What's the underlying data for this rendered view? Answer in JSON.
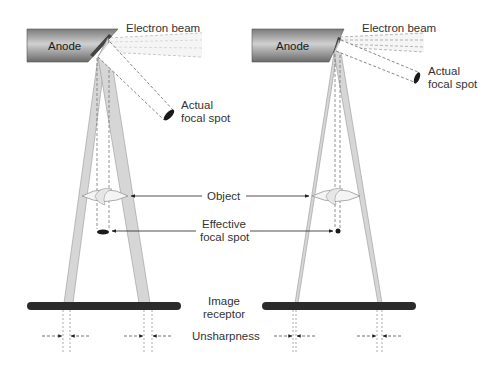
{
  "diagram": {
    "panels": [
      {
        "id": "large-focal-spot",
        "anode_label": "Anode",
        "electron_beam_label": "Electron beam",
        "actual_focal_spot_label": [
          "Actual",
          "focal spot"
        ]
      },
      {
        "id": "small-focal-spot",
        "anode_label": "Anode",
        "electron_beam_label": "Electron beam",
        "actual_focal_spot_label": [
          "Actual",
          "focal spot"
        ]
      }
    ],
    "center_labels": {
      "object": "Object",
      "effective_focal_spot": [
        "Effective",
        "focal spot"
      ],
      "image_receptor": [
        "Image",
        "receptor"
      ],
      "unsharpness": "Unsharpness"
    },
    "colors": {
      "anode_dark": "#6e6e6e",
      "anode_light": "#c8c8c8",
      "receptor": "#2b2b2b",
      "penumbra": "#cfcfcf",
      "line": "#555555",
      "text": "#333333"
    }
  }
}
